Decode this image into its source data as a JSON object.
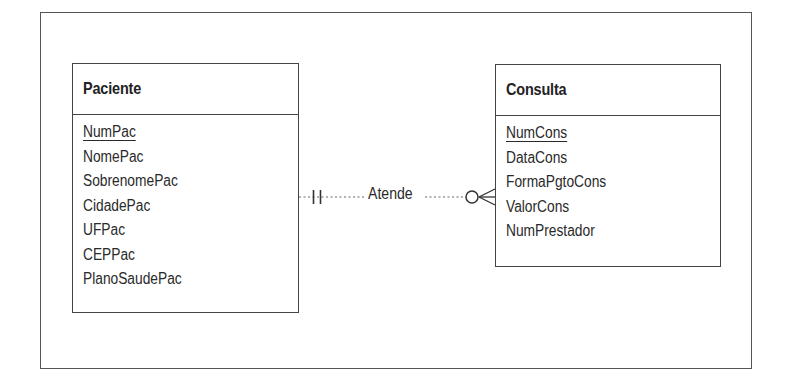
{
  "diagram": {
    "type": "entity-relationship",
    "notation": "crow's foot",
    "entities": [
      {
        "name": "Paciente",
        "attributes": [
          {
            "name": "NumPac",
            "primary_key": true
          },
          {
            "name": "NomePac",
            "primary_key": false
          },
          {
            "name": "SobrenomePac",
            "primary_key": false
          },
          {
            "name": "CidadePac",
            "primary_key": false
          },
          {
            "name": "UFPac",
            "primary_key": false
          },
          {
            "name": "CEPPac",
            "primary_key": false
          },
          {
            "name": "PlanoSaudePac",
            "primary_key": false
          }
        ]
      },
      {
        "name": "Consulta",
        "attributes": [
          {
            "name": "NumCons",
            "primary_key": true
          },
          {
            "name": "DataCons",
            "primary_key": false
          },
          {
            "name": "FormaPgtoCons",
            "primary_key": false
          },
          {
            "name": "ValorCons",
            "primary_key": false
          },
          {
            "name": "NumPrestador",
            "primary_key": false
          }
        ]
      }
    ],
    "relationships": [
      {
        "label": "Atende",
        "from": "Paciente",
        "to": "Consulta",
        "from_cardinality": "exactly one (||)",
        "to_cardinality": "zero or many (o<)",
        "line_style": "dotted"
      }
    ]
  },
  "colors": {
    "line": "#444444",
    "text": "#2a2a2a",
    "background": "#ffffff"
  }
}
